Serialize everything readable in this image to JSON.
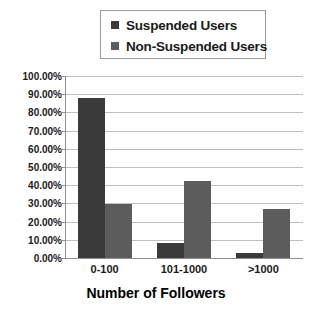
{
  "chart_data": {
    "type": "bar",
    "title": "",
    "xlabel": "Number of Followers",
    "ylabel": "",
    "categories": [
      "0-100",
      "101-1000",
      ">1000"
    ],
    "series": [
      {
        "name": "Suspended Users",
        "values": [
          88.0,
          8.5,
          3.0
        ],
        "color": "#3a3a3a"
      },
      {
        "name": "Non-Suspended Users",
        "values": [
          29.5,
          42.5,
          27.0
        ],
        "color": "#5c5c5c"
      }
    ],
    "ylim": [
      0,
      100
    ],
    "ytick_values": [
      0,
      10,
      20,
      30,
      40,
      50,
      60,
      70,
      80,
      90,
      100
    ],
    "ytick_labels": [
      "0.00%",
      "10.00%",
      "20.00%",
      "30.00%",
      "40.00%",
      "50.00%",
      "60.00%",
      "70.00%",
      "80.00%",
      "90.00%",
      "100.00%"
    ],
    "grid": true,
    "legend_position": "top-center",
    "plot_background": "#ffffff",
    "gridline_color": "#bfbfbf",
    "axis_color": "#8f8f8f"
  },
  "legend": {
    "entries": [
      {
        "label": "Suspended Users",
        "swatch": "#3a3a3a"
      },
      {
        "label": "Non-Suspended Users",
        "swatch": "#5c5c5c"
      }
    ]
  },
  "axis": {
    "x_title": "Number of Followers"
  }
}
